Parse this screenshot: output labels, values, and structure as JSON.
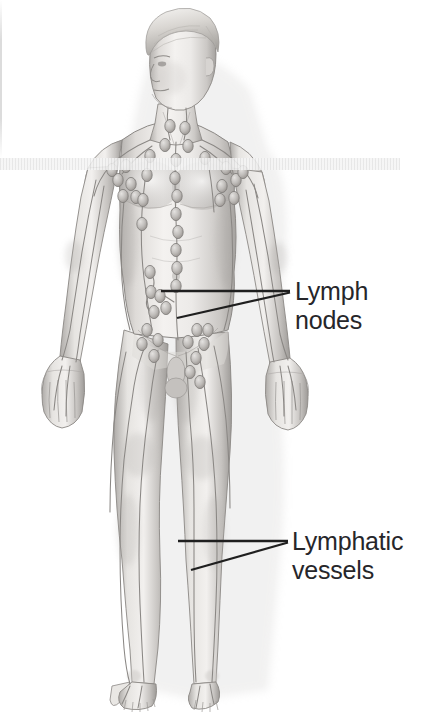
{
  "figure": {
    "style": "grayscale pencil / airbrush medical illustration",
    "background_color": "#ffffff",
    "line_color": "#2b2b2b",
    "skin_tone_light": "#f2f0ee",
    "skin_tone_mid": "#cfccc9",
    "skin_tone_shadow": "#a9a6a3",
    "vessel_color": "#8d8a87",
    "node_color": "#b9b6b3",
    "node_outline": "#7e7b78"
  },
  "annotations": [
    {
      "id": "lymph-nodes",
      "line1": "Lymph",
      "line2": "nodes",
      "target": "abdominal and inguinal lymph node chain",
      "leader_horizontal": {
        "x1": 161,
        "y1": 291,
        "x2": 290,
        "y2": 291
      },
      "leader_angled": {
        "x1": 177,
        "y1": 318,
        "x2": 290,
        "y2": 292
      }
    },
    {
      "id": "lymphatic-vessels",
      "line1": "Lymphatic",
      "line2": "vessels",
      "target": "superficial vessels of the left leg",
      "leader_horizontal": {
        "x1": 178,
        "y1": 541,
        "x2": 288,
        "y2": 541
      },
      "leader_angled": {
        "x1": 191,
        "y1": 570,
        "x2": 288,
        "y2": 542
      }
    }
  ],
  "anatomy": {
    "node_groups": [
      "cervical",
      "supraclavicular",
      "axillary",
      "thoracic",
      "abdominal",
      "inguinal"
    ],
    "vessel_regions": [
      "arms",
      "hands",
      "torso",
      "legs",
      "feet"
    ]
  },
  "page_artifacts": {
    "left_edge_line": true,
    "bottom_band": true
  }
}
